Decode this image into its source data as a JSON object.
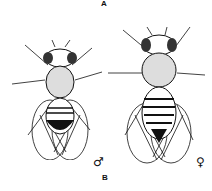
{
  "figure": {
    "panel_label_top": "A",
    "panel_label_bottom": "B",
    "subjects": [
      {
        "name": "male fruit fly",
        "symbol": "♂"
      },
      {
        "name": "female fruit fly",
        "symbol": "♀"
      }
    ]
  }
}
